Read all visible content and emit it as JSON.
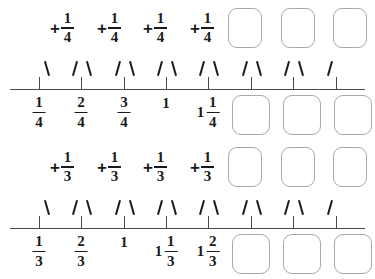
{
  "document": {
    "title": "Fraction Number Line Skip Counting Worksheet",
    "type": "math-worksheet"
  },
  "symbols": {
    "plus": "+",
    "one": "1"
  },
  "exercises": [
    {
      "id": "quarters",
      "step_label": "1/4",
      "expression": {
        "terms": [
          {
            "plus": "+",
            "numerator": "1",
            "denominator": "4",
            "filled": true
          },
          {
            "plus": "+",
            "numerator": "1",
            "denominator": "4",
            "filled": true
          },
          {
            "plus": "+",
            "numerator": "1",
            "denominator": "4",
            "filled": true
          },
          {
            "plus": "+",
            "numerator": "1",
            "denominator": "4",
            "filled": true
          },
          {
            "plus": "+",
            "numerator": "",
            "denominator": "",
            "filled": false
          },
          {
            "plus": "+",
            "numerator": "",
            "denominator": "",
            "filled": false
          },
          {
            "plus": "+",
            "numerator": "",
            "denominator": "",
            "filled": false
          }
        ]
      },
      "ticks": [
        {
          "x": 39,
          "arc_left": false,
          "arc_right": true,
          "label": {
            "whole": "",
            "numerator": "1",
            "denominator": "4",
            "filled": true
          }
        },
        {
          "x": 81,
          "arc_left": true,
          "arc_right": true,
          "label": {
            "whole": "",
            "numerator": "2",
            "denominator": "4",
            "filled": true
          }
        },
        {
          "x": 124,
          "arc_left": true,
          "arc_right": true,
          "label": {
            "whole": "",
            "numerator": "3",
            "denominator": "4",
            "filled": true
          }
        },
        {
          "x": 166,
          "arc_left": true,
          "arc_right": true,
          "label": {
            "whole": "1",
            "numerator": "",
            "denominator": "",
            "filled": true
          }
        },
        {
          "x": 208,
          "arc_left": true,
          "arc_right": true,
          "label": {
            "whole": "1",
            "numerator": "1",
            "denominator": "4",
            "filled": true
          }
        },
        {
          "x": 251,
          "arc_left": true,
          "arc_right": true,
          "label": {
            "whole": "",
            "numerator": "",
            "denominator": "",
            "filled": false
          }
        },
        {
          "x": 293,
          "arc_left": true,
          "arc_right": true,
          "label": {
            "whole": "",
            "numerator": "",
            "denominator": "",
            "filled": false
          }
        },
        {
          "x": 336,
          "arc_left": true,
          "arc_right": false,
          "label": {
            "whole": "",
            "numerator": "",
            "denominator": "",
            "filled": false
          }
        }
      ]
    },
    {
      "id": "thirds",
      "step_label": "1/3",
      "expression": {
        "terms": [
          {
            "plus": "+",
            "numerator": "1",
            "denominator": "3",
            "filled": true
          },
          {
            "plus": "+",
            "numerator": "1",
            "denominator": "3",
            "filled": true
          },
          {
            "plus": "+",
            "numerator": "1",
            "denominator": "3",
            "filled": true
          },
          {
            "plus": "+",
            "numerator": "1",
            "denominator": "3",
            "filled": true
          },
          {
            "plus": "+",
            "numerator": "",
            "denominator": "",
            "filled": false
          },
          {
            "plus": "+",
            "numerator": "",
            "denominator": "",
            "filled": false
          },
          {
            "plus": "+",
            "numerator": "",
            "denominator": "",
            "filled": false
          }
        ]
      },
      "ticks": [
        {
          "x": 39,
          "arc_left": false,
          "arc_right": true,
          "label": {
            "whole": "",
            "numerator": "1",
            "denominator": "3",
            "filled": true
          }
        },
        {
          "x": 81,
          "arc_left": true,
          "arc_right": true,
          "label": {
            "whole": "",
            "numerator": "2",
            "denominator": "3",
            "filled": true
          }
        },
        {
          "x": 124,
          "arc_left": true,
          "arc_right": true,
          "label": {
            "whole": "1",
            "numerator": "",
            "denominator": "",
            "filled": true
          }
        },
        {
          "x": 166,
          "arc_left": true,
          "arc_right": true,
          "label": {
            "whole": "1",
            "numerator": "1",
            "denominator": "3",
            "filled": true
          }
        },
        {
          "x": 208,
          "arc_left": true,
          "arc_right": true,
          "label": {
            "whole": "1",
            "numerator": "2",
            "denominator": "3",
            "filled": true
          }
        },
        {
          "x": 251,
          "arc_left": true,
          "arc_right": true,
          "label": {
            "whole": "",
            "numerator": "",
            "denominator": "",
            "filled": false
          }
        },
        {
          "x": 293,
          "arc_left": true,
          "arc_right": true,
          "label": {
            "whole": "",
            "numerator": "",
            "denominator": "",
            "filled": false
          }
        },
        {
          "x": 336,
          "arc_left": true,
          "arc_right": false,
          "label": {
            "whole": "",
            "numerator": "",
            "denominator": "",
            "filled": false
          }
        }
      ]
    }
  ],
  "layout": {
    "term_x": [
      50,
      97,
      143,
      190,
      232,
      285,
      337
    ],
    "box_top_x": [
      228,
      281,
      333
    ],
    "box_bottom_x": [
      232,
      283,
      334
    ],
    "line_y_first": 89,
    "line_y_second": 229
  },
  "colors": {
    "ink": "#1a1a1a",
    "line": "#4a4a4a",
    "box_border": "#a8a8a8",
    "background": "#ffffff"
  }
}
